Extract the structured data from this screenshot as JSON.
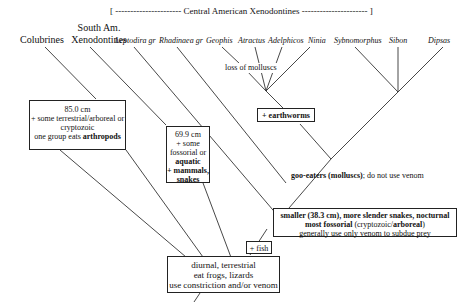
{
  "header": {
    "bracket_label": "[ ---------------------- Central American Xenodontines ---------------------- ]"
  },
  "taxa": [
    {
      "label": "Colubrines",
      "italic": false
    },
    {
      "label_line1": "South Am.",
      "label_line2": "Xenodontines",
      "italic": false
    },
    {
      "label": "Leptodira gr",
      "italic": true
    },
    {
      "label": "Rhadinaea gr",
      "italic": true
    },
    {
      "label": "Geophis",
      "italic": true
    },
    {
      "label": "Atractus",
      "italic": true
    },
    {
      "label": "Adelphicos",
      "italic": true
    },
    {
      "label": "Ninia",
      "italic": true
    },
    {
      "label": "Sybnomorphus",
      "italic": true
    },
    {
      "label": "Sibon",
      "italic": true
    },
    {
      "label": "Dipsas",
      "italic": true
    }
  ],
  "annotations": {
    "loss_of_molluscs": "loss of molluscs",
    "goo_eaters_bold": "goo-eaters",
    "goo_eaters_paren": " (molluscs)",
    "goo_eaters_rest": "; do not use venom"
  },
  "boxes": {
    "colubrines": {
      "line1": "85.0 cm",
      "line2": "+ some terrestrial/arboreal or",
      "line3": "cryptozoic",
      "line4_prefix": "one group eats ",
      "line4_bold": "arthropods"
    },
    "south_am": {
      "line1": "69.9 cm",
      "line2": "+ some",
      "line3": "fossorial or",
      "line4_bold": "aquatic",
      "line5_bold": "+ mammals,",
      "line6_bold": "snakes"
    },
    "earthworms": {
      "label": "+ earthworms"
    },
    "central_am": {
      "line1_bold": "smaller (38.3 cm), more slender snakes, nocturnal",
      "line2_bold": "most fossorial",
      "line2_paren_open": " (cryptozoic/",
      "line2_paren_bold": "arboreal",
      "line2_paren_close": ")",
      "line3": "generally use only venom to subdue prey"
    },
    "fish": {
      "label": "+ fish"
    },
    "root": {
      "line1": "diurnal, terrestrial",
      "line2": "eat frogs, lizards",
      "line3": "use constriction and/or venom"
    }
  }
}
